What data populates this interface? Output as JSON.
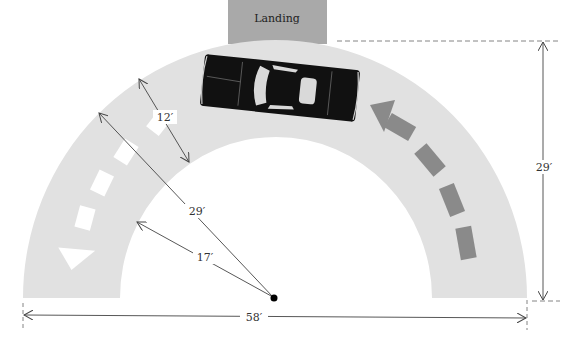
{
  "landing": {
    "label": "Landing",
    "fill": "#a9a9a9"
  },
  "road": {
    "fill": "#e1e1e1"
  },
  "car": {
    "body": "#111111",
    "glass": "#d9d9d9"
  },
  "arrows": {
    "exit_direction": {
      "color": "#ffffff"
    },
    "entry_direction": {
      "color": "#8a8a8a"
    }
  },
  "dimensions": {
    "lane_width": "12′",
    "outer_radius": "29′",
    "inner_radius": "17′",
    "total_width": "58′",
    "total_height": "29′"
  },
  "center_point": {
    "color": "#000000"
  }
}
